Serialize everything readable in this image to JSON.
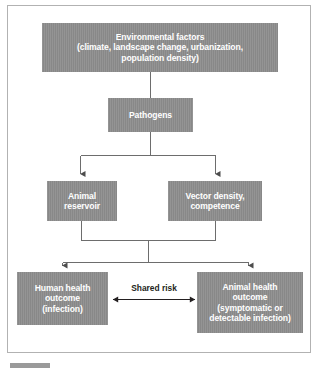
{
  "figure": {
    "background_color": "#ffffff",
    "border_color": "#b2b2b2",
    "node_fill_color": "#8c8c8c",
    "node_text_color": "#ffffff",
    "connector_color": "#6d6d6d",
    "label_text_color": "#231f20"
  },
  "nodes": {
    "environmental": {
      "lines": [
        "Environmental factors",
        "(climate, landscape change, urbanization,",
        "population density)"
      ]
    },
    "pathogens": {
      "lines": [
        "Pathogens"
      ]
    },
    "animal_reservoir": {
      "lines": [
        "Animal",
        "reservoir"
      ]
    },
    "vector": {
      "lines": [
        "Vector density,",
        "competence"
      ]
    },
    "human_health": {
      "lines": [
        "Human health",
        "outcome",
        "(infection)"
      ]
    },
    "animal_health": {
      "lines": [
        "Animal health",
        "outcome",
        "(symptomatic or",
        "detectable infection)"
      ]
    }
  },
  "connectors": {
    "shared_risk_label": "Shared risk"
  },
  "caption": {
    "text": ""
  }
}
